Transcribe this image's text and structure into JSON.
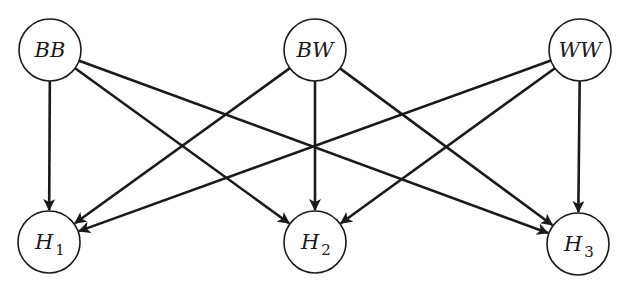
{
  "diagram": {
    "type": "bipartite directed graph",
    "top_nodes": [
      {
        "id": "BB",
        "label": "BB",
        "x": 50,
        "y": 50
      },
      {
        "id": "BW",
        "label": "BW",
        "x": 315,
        "y": 50
      },
      {
        "id": "WW",
        "label": "WW",
        "x": 580,
        "y": 50
      }
    ],
    "bottom_nodes": [
      {
        "id": "H1",
        "label": "H",
        "subscript": "1",
        "x": 49,
        "y": 242
      },
      {
        "id": "H2",
        "label": "H",
        "subscript": "2",
        "x": 315,
        "y": 242
      },
      {
        "id": "H3",
        "label": "H",
        "subscript": "3",
        "x": 578,
        "y": 244
      }
    ],
    "edges": [
      {
        "from": "BB",
        "to": "H1"
      },
      {
        "from": "BB",
        "to": "H2"
      },
      {
        "from": "BB",
        "to": "H3"
      },
      {
        "from": "BW",
        "to": "H1"
      },
      {
        "from": "BW",
        "to": "H2"
      },
      {
        "from": "BW",
        "to": "H3"
      },
      {
        "from": "WW",
        "to": "H1"
      },
      {
        "from": "WW",
        "to": "H2"
      },
      {
        "from": "WW",
        "to": "H3"
      }
    ],
    "node_radius": 31,
    "stroke_color": "#1a1a1a",
    "background": "#ffffff"
  }
}
